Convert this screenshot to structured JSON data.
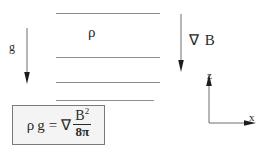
{
  "figure": {
    "background_color": "#ffffff",
    "line_color": "#8d8d8d",
    "ink_color": "#2b2b2b",
    "box_fill_color": "#f4f4f4",
    "box_border_color": "#7a7a7a"
  },
  "layers": {
    "count": 4,
    "density_label": "ρ"
  },
  "gravity": {
    "label": "g",
    "arrow_direction": "down"
  },
  "field_gradient": {
    "label": "∇ B",
    "arrow_direction": "down"
  },
  "equation": {
    "lhs_rho": "ρ",
    "lhs_g": "g",
    "equals": "=",
    "nabla": "∇",
    "numerator": "B",
    "numerator_exponent": "2",
    "denominator": "8π",
    "full_text": "ρ g = ∇ B² / 8π"
  },
  "axes": {
    "vertical_label": "z",
    "horizontal_label": "x"
  }
}
